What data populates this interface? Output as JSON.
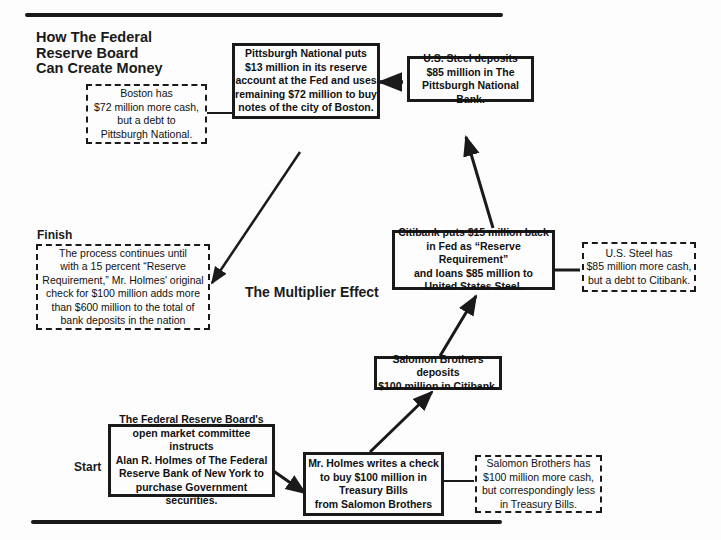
{
  "title": "How The Federal\nReserve Board\nCan Create Money",
  "center_label": "The Multiplier Effect",
  "labels": {
    "start": "Start",
    "finish": "Finish"
  },
  "nodes": {
    "start": "The Federal Reserve Board's\nopen market committee instructs\nAlan R. Holmes of The Federal\nReserve Bank of New York to\npurchase Government securities.",
    "holmes": "Mr. Holmes writes a check\nto buy $100 million in\nTreasury Bills\nfrom Salomon Brothers",
    "salomon_deposit": "Salomon Brothers deposits\n$100 million in Citibank.",
    "citibank": "Citibank puts $15 million back\nin Fed as “Reserve Requirement”\nand loans $85 million to\nUnited States Steel.",
    "us_steel_deposit": "U.S. Steel deposits\n$85 million in The\nPittsburgh National Bank.",
    "pittsburgh": "Pittsburgh National puts\n$13 million in its reserve\naccount at the Fed and uses\nremaining $72 million to buy\nnotes of the city of Boston."
  },
  "notes": {
    "boston": "Boston has\n$72 million more cash,\nbut a debt to\nPittsburgh National.",
    "us_steel": "U.S. Steel has\n$85 million more cash,\nbut a debt to Citibank.",
    "salomon": "Salomon Brothers has\n$100 million more cash,\nbut correspondingly less\nin Treasury Bills.",
    "finish": "The process continues until\nwith a 15 percent “Reserve\nRequirement,” Mr. Holmes' original\ncheck for $100 million adds more\nthan $600 million to the total of\nbank deposits in the nation"
  },
  "colors": {
    "ink": "#1a1a1a",
    "paper": "#fdfdfd"
  }
}
